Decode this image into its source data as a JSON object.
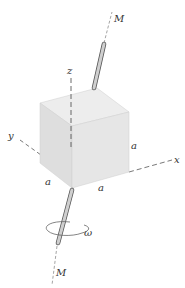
{
  "diagram": {
    "labels": {
      "axis_top": "M",
      "axis_bottom": "M",
      "z_axis": "z",
      "y_axis": "y",
      "x_axis": "x",
      "side_vertical": "a",
      "side_left": "a",
      "side_right": "a",
      "angular_velocity": "ω"
    },
    "colors": {
      "cube_top": "#ececec",
      "cube_left": "#dcdcdc",
      "cube_right": "#e4e4e4",
      "line": "#444444",
      "rod": "#b8b8b8"
    }
  }
}
